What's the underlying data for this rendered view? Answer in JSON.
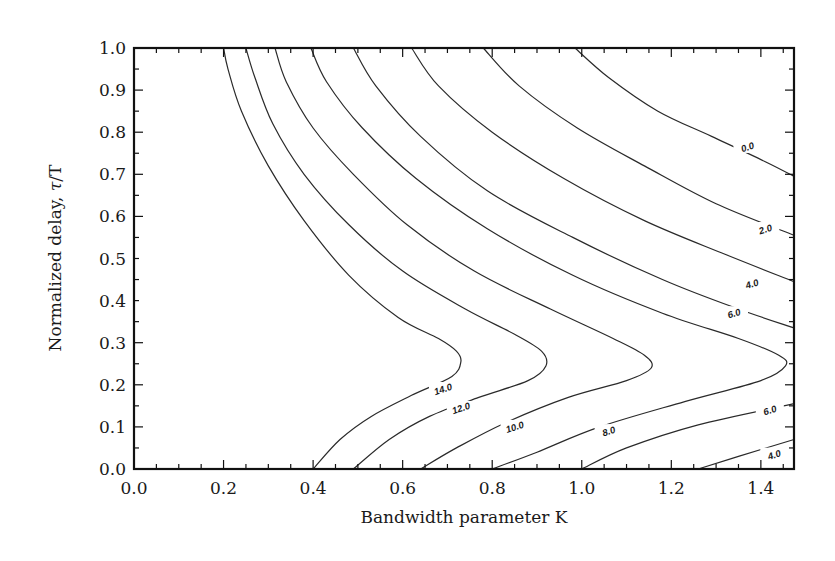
{
  "chart_data": {
    "type": "contour",
    "title": "",
    "xlabel": "Bandwidth parameter K",
    "ylabel": "Normalized delay, τ/T",
    "xlim": [
      0.0,
      1.474
    ],
    "ylim": [
      0.0,
      1.0
    ],
    "grid": false,
    "legend": null,
    "x_ticks": [
      "0.0",
      "0.2",
      "0.4",
      "0.6",
      "0.8",
      "1.0",
      "1.2",
      "1.4"
    ],
    "y_ticks": [
      "0.0",
      "0.1",
      "0.2",
      "0.3",
      "0.4",
      "0.5",
      "0.6",
      "0.7",
      "0.8",
      "0.9",
      "1.0"
    ],
    "contour_levels": [
      0.0,
      2.0,
      4.0,
      6.0,
      8.0,
      10.0,
      12.0,
      14.0
    ],
    "contours": [
      {
        "level": "14.0",
        "label_pos": [
          0.69,
          0.19
        ],
        "points": [
          [
            0.2,
            1.0
          ],
          [
            0.21,
            0.95
          ],
          [
            0.24,
            0.85
          ],
          [
            0.3,
            0.72
          ],
          [
            0.38,
            0.59
          ],
          [
            0.48,
            0.46
          ],
          [
            0.59,
            0.36
          ],
          [
            0.68,
            0.31
          ],
          [
            0.72,
            0.28
          ],
          [
            0.73,
            0.255
          ],
          [
            0.71,
            0.22
          ],
          [
            0.62,
            0.175
          ],
          [
            0.53,
            0.125
          ],
          [
            0.46,
            0.07
          ],
          [
            0.4,
            0.0
          ]
        ]
      },
      {
        "level": "12.0",
        "label_pos": [
          0.73,
          0.145
        ],
        "points": [
          [
            0.25,
            1.0
          ],
          [
            0.27,
            0.93
          ],
          [
            0.31,
            0.82
          ],
          [
            0.38,
            0.7
          ],
          [
            0.48,
            0.58
          ],
          [
            0.6,
            0.47
          ],
          [
            0.74,
            0.38
          ],
          [
            0.85,
            0.32
          ],
          [
            0.91,
            0.28
          ],
          [
            0.92,
            0.245
          ],
          [
            0.88,
            0.21
          ],
          [
            0.77,
            0.17
          ],
          [
            0.66,
            0.125
          ],
          [
            0.57,
            0.07
          ],
          [
            0.49,
            0.0
          ]
        ]
      },
      {
        "level": "10.0",
        "label_pos": [
          0.85,
          0.1
        ],
        "points": [
          [
            0.315,
            1.0
          ],
          [
            0.34,
            0.92
          ],
          [
            0.4,
            0.81
          ],
          [
            0.49,
            0.7
          ],
          [
            0.61,
            0.58
          ],
          [
            0.76,
            0.47
          ],
          [
            0.93,
            0.38
          ],
          [
            1.07,
            0.31
          ],
          [
            1.14,
            0.27
          ],
          [
            1.155,
            0.24
          ],
          [
            1.1,
            0.21
          ],
          [
            0.97,
            0.17
          ],
          [
            0.83,
            0.11
          ],
          [
            0.72,
            0.05
          ],
          [
            0.64,
            0.0
          ]
        ]
      },
      {
        "level": "8.0",
        "label_pos": [
          1.06,
          0.09
        ],
        "points": [
          [
            0.395,
            1.0
          ],
          [
            0.43,
            0.92
          ],
          [
            0.51,
            0.81
          ],
          [
            0.63,
            0.69
          ],
          [
            0.79,
            0.57
          ],
          [
            0.98,
            0.46
          ],
          [
            1.18,
            0.37
          ],
          [
            1.35,
            0.31
          ],
          [
            1.44,
            0.27
          ],
          [
            1.455,
            0.245
          ],
          [
            1.4,
            0.21
          ],
          [
            1.23,
            0.16
          ],
          [
            1.04,
            0.1
          ],
          [
            0.9,
            0.04
          ],
          [
            0.8,
            0.0
          ]
        ]
      },
      {
        "level": "6.0",
        "label_pos": [
          1.42,
          0.14
        ],
        "points": [
          [
            0.49,
            1.0
          ],
          [
            0.54,
            0.91
          ],
          [
            0.64,
            0.79
          ],
          [
            0.79,
            0.66
          ],
          [
            0.98,
            0.55
          ],
          [
            1.18,
            0.45
          ],
          [
            1.35,
            0.38
          ],
          [
            1.474,
            0.335
          ]
        ],
        "lower_branch": [
          [
            1.0,
            0.0
          ],
          [
            1.1,
            0.05
          ],
          [
            1.26,
            0.105
          ],
          [
            1.474,
            0.155
          ]
        ],
        "upper_label_pos": [
          1.34,
          0.37
        ]
      },
      {
        "level": "4.0",
        "label_pos": [
          1.38,
          0.44
        ],
        "points": [
          [
            0.62,
            1.0
          ],
          [
            0.68,
            0.91
          ],
          [
            0.8,
            0.8
          ],
          [
            0.96,
            0.69
          ],
          [
            1.14,
            0.59
          ],
          [
            1.32,
            0.51
          ],
          [
            1.474,
            0.445
          ]
        ],
        "lower_branch": [
          [
            1.26,
            0.0
          ],
          [
            1.35,
            0.03
          ],
          [
            1.474,
            0.07
          ]
        ],
        "lower_label_pos": [
          1.43,
          0.034
        ]
      },
      {
        "level": "2.0",
        "label_pos": [
          1.41,
          0.57
        ],
        "points": [
          [
            0.78,
            1.0
          ],
          [
            0.86,
            0.91
          ],
          [
            0.99,
            0.81
          ],
          [
            1.14,
            0.72
          ],
          [
            1.3,
            0.63
          ],
          [
            1.474,
            0.555
          ]
        ]
      },
      {
        "level": "0.0",
        "label_pos": [
          1.37,
          0.765
        ],
        "points": [
          [
            0.985,
            1.0
          ],
          [
            1.06,
            0.93
          ],
          [
            1.17,
            0.85
          ],
          [
            1.29,
            0.79
          ],
          [
            1.41,
            0.73
          ],
          [
            1.474,
            0.695
          ]
        ]
      }
    ]
  },
  "axes": {
    "xlabel": "Bandwidth parameter K",
    "ylabel_main": "Normalized delay, ",
    "ylabel_symbol": "τ",
    "ylabel_tail": "/T"
  }
}
